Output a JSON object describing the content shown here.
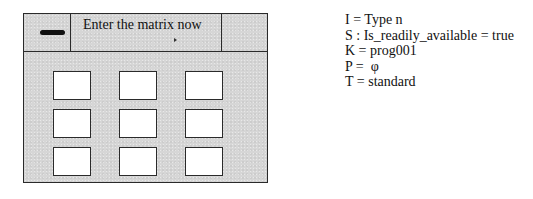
{
  "dialog": {
    "title": "Enter the matrix now",
    "left_button_icon": "minus-icon",
    "matrix": {
      "rows": 3,
      "cols": 3,
      "cells": [
        [
          "",
          "",
          ""
        ],
        [
          "",
          "",
          ""
        ],
        [
          "",
          "",
          ""
        ]
      ]
    }
  },
  "properties": [
    {
      "text": "I = Type n"
    },
    {
      "text": "S : Is_readily_available = true"
    },
    {
      "text": "K = prog001"
    },
    {
      "text": "P =  φ"
    },
    {
      "text": "T = standard"
    }
  ]
}
